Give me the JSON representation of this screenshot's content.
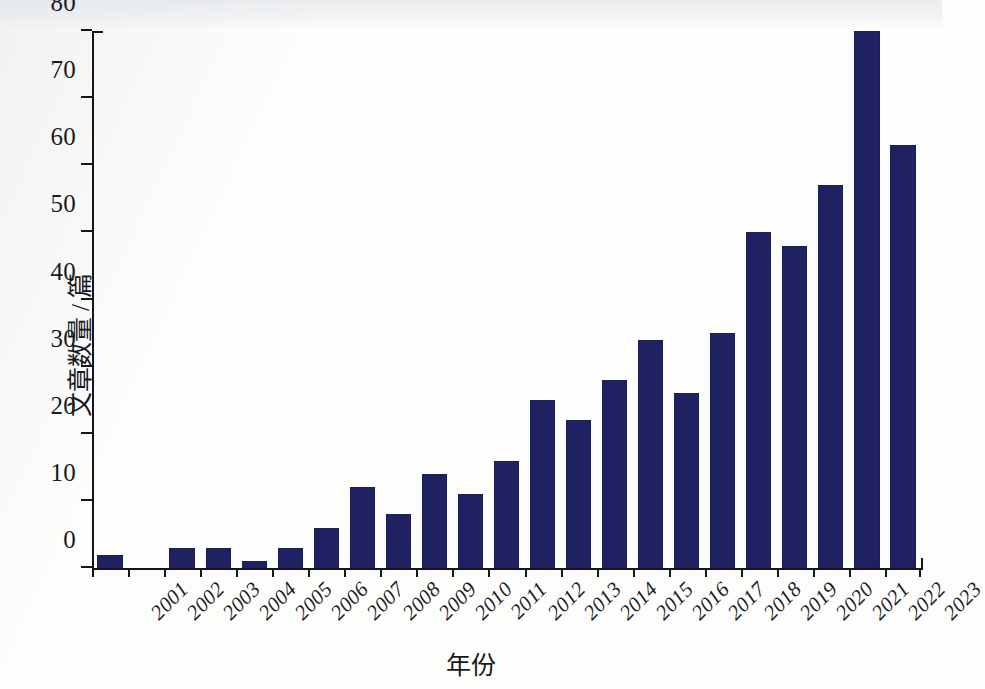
{
  "chart_data": {
    "type": "bar",
    "title": "",
    "subtitle": "",
    "xlabel": "年份",
    "ylabel": "文章数量 / 篇",
    "categories": [
      "2001",
      "2002",
      "2003",
      "2004",
      "2005",
      "2006",
      "2007",
      "2008",
      "2009",
      "2010",
      "2011",
      "2012",
      "2013",
      "2014",
      "2015",
      "2016",
      "2017",
      "2018",
      "2019",
      "2020",
      "2021",
      "2022",
      "2023"
    ],
    "values": [
      2,
      0,
      3,
      3,
      1,
      3,
      6,
      12,
      8,
      14,
      11,
      16,
      25,
      22,
      28,
      34,
      26,
      35,
      50,
      48,
      57,
      80,
      63
    ],
    "series": [
      {
        "name": "文章数量",
        "values": [
          2,
          0,
          3,
          3,
          1,
          3,
          6,
          12,
          8,
          14,
          11,
          16,
          25,
          22,
          28,
          34,
          26,
          35,
          50,
          48,
          57,
          80,
          63
        ]
      }
    ],
    "ylim": [
      0,
      80
    ],
    "y_ticks": [
      0,
      10,
      20,
      30,
      40,
      50,
      60,
      70,
      80
    ],
    "y_tick_labels": [
      "0",
      "10",
      "20",
      "30",
      "40",
      "50",
      "60",
      "70",
      "80"
    ],
    "grid": false,
    "legend": null,
    "legend_position": "none",
    "bar_color": "#1f2160",
    "axis_color": "#15161b",
    "background_color": "#fdfdfc",
    "x_tick_rotation": -45
  }
}
